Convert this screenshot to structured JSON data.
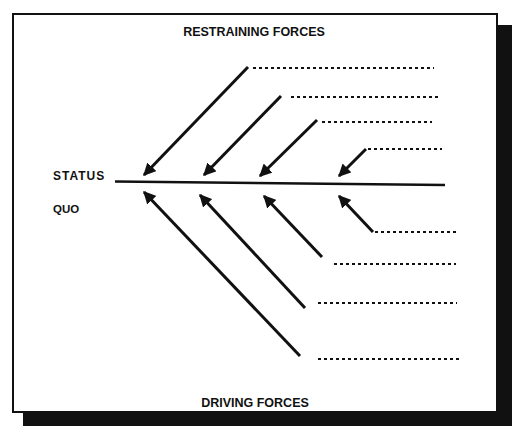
{
  "diagram": {
    "type": "force-field-analysis",
    "top_label": "RESTRAINING FORCES",
    "bottom_label": "DRIVING FORCES",
    "status_label_line1": "STATUS",
    "status_label_line2": "QUO",
    "restraining_forces": [
      {
        "label": ""
      },
      {
        "label": ""
      },
      {
        "label": ""
      },
      {
        "label": ""
      }
    ],
    "driving_forces": [
      {
        "label": ""
      },
      {
        "label": ""
      },
      {
        "label": ""
      },
      {
        "label": ""
      }
    ],
    "colors": {
      "ink": "#111111",
      "background": "#ffffff"
    }
  }
}
